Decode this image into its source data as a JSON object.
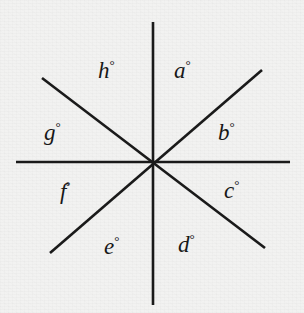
{
  "figure": {
    "kind": "intersecting-lines-angle-diagram",
    "background_color": "#f2f2f1",
    "line_color": "#1a1a1a",
    "text_color": "#171717",
    "line_width": 2.6,
    "center": {
      "x": 153,
      "y": 162
    },
    "degree_symbol": "°",
    "lines": [
      {
        "name": "horizontal-line",
        "x1": 16,
        "y1": 162,
        "x2": 290,
        "y2": 162
      },
      {
        "name": "vertical-line",
        "x1": 153,
        "y1": 22,
        "x2": 153,
        "y2": 305
      },
      {
        "name": "diagonal-ne-sw",
        "x1": 50,
        "y1": 253,
        "x2": 262,
        "y2": 70
      },
      {
        "name": "diagonal-nw-se",
        "x1": 42,
        "y1": 78,
        "x2": 265,
        "y2": 248
      }
    ],
    "angle_labels": [
      {
        "id": "a",
        "letter": "a",
        "sector": "upper-right-inner",
        "x": 174,
        "y": 58
      },
      {
        "id": "b",
        "letter": "b",
        "sector": "right-upper",
        "x": 218,
        "y": 120
      },
      {
        "id": "c",
        "letter": "c",
        "sector": "right-lower",
        "x": 224,
        "y": 178
      },
      {
        "id": "d",
        "letter": "d",
        "sector": "lower-right-inner",
        "x": 178,
        "y": 232
      },
      {
        "id": "e",
        "letter": "e",
        "sector": "lower-left-inner",
        "x": 104,
        "y": 234
      },
      {
        "id": "f",
        "letter": "f",
        "sector": "left-lower",
        "x": 60,
        "y": 180
      },
      {
        "id": "g",
        "letter": "g",
        "sector": "left-upper",
        "x": 44,
        "y": 120
      },
      {
        "id": "h",
        "letter": "h",
        "sector": "upper-left-inner",
        "x": 98,
        "y": 58
      }
    ]
  }
}
